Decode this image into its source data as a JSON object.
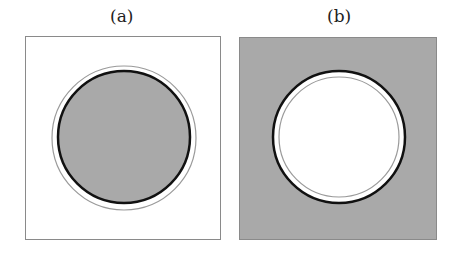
{
  "panels": [
    {
      "label": "(a)",
      "inside_fill": "#a9a9a9",
      "outside_fill": "#ffffff"
    },
    {
      "label": "(b)",
      "inside_fill": "#ffffff",
      "outside_fill": "#a9a9a9"
    }
  ],
  "colors": {
    "gray_fill": "#a9a9a9",
    "boundary": "#111111",
    "thin_ring": "#9a9a9a",
    "frame": "#8a8a8a"
  }
}
